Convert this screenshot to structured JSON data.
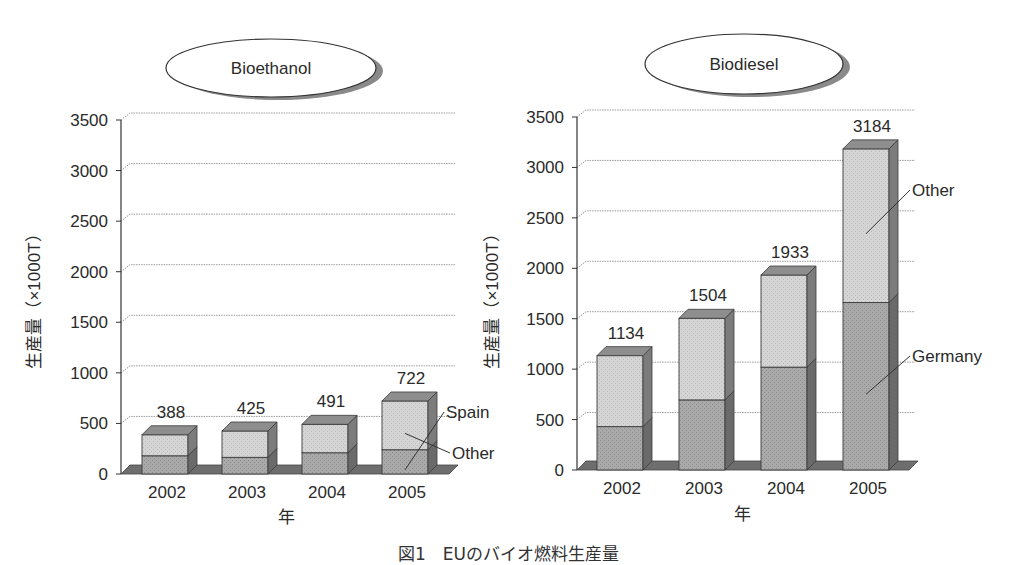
{
  "caption": "図1　EUのバイオ燃料生産量",
  "chart_data": [
    {
      "type": "bar",
      "stacked": true,
      "style": "3d",
      "title": "Bioethanol",
      "xlabel": "年",
      "ylabel": "生産量（×1000T）",
      "categories": [
        "2002",
        "2003",
        "2004",
        "2005"
      ],
      "series": [
        {
          "name": "Spain",
          "values": [
            180,
            165,
            210,
            240
          ]
        },
        {
          "name": "Other",
          "values": [
            208,
            260,
            281,
            482
          ]
        }
      ],
      "totals": [
        388,
        425,
        491,
        722
      ],
      "yticks": [
        0,
        500,
        1000,
        1500,
        2000,
        2500,
        3000,
        3500
      ],
      "ylim": [
        0,
        3500
      ],
      "grid": true,
      "legend": "inline labels at right of last bar",
      "colors": {
        "Spain": "#a9a9a9",
        "Other": "#d2d2d2"
      }
    },
    {
      "type": "bar",
      "stacked": true,
      "style": "3d",
      "title": "Biodiesel",
      "xlabel": "年",
      "ylabel": "生産量（×1000T）",
      "categories": [
        "2002",
        "2003",
        "2004",
        "2005"
      ],
      "series": [
        {
          "name": "Germany",
          "values": [
            430,
            695,
            1020,
            1660
          ]
        },
        {
          "name": "Other",
          "values": [
            704,
            809,
            913,
            1524
          ]
        }
      ],
      "totals": [
        1134,
        1504,
        1933,
        3184
      ],
      "yticks": [
        0,
        500,
        1000,
        1500,
        2000,
        2500,
        3000,
        3500
      ],
      "ylim": [
        0,
        3500
      ],
      "grid": true,
      "legend": "inline labels at right of last bar",
      "colors": {
        "Germany": "#a9a9a9",
        "Other": "#d8d8d8"
      }
    }
  ]
}
